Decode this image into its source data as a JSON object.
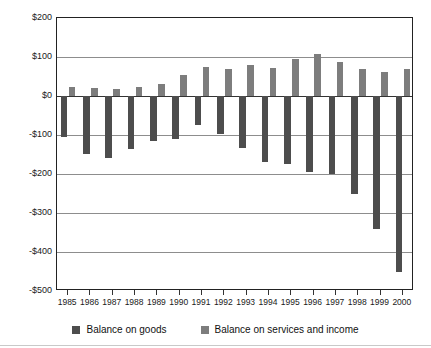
{
  "chart_data": {
    "type": "bar",
    "title": "",
    "subtitle": "",
    "xlabel": "",
    "ylabel": "",
    "grid": true,
    "legend_position": "bottom",
    "ylim": [
      -500,
      200
    ],
    "ytick_labels": [
      "$200",
      "$100",
      "$0",
      "-$100",
      "-$200",
      "-$300",
      "-$400",
      "-$500"
    ],
    "ytick_values": [
      200,
      100,
      0,
      -100,
      -200,
      -300,
      -400,
      -500
    ],
    "categories": [
      "1985",
      "1986",
      "1987",
      "1988",
      "1989",
      "1990",
      "1991",
      "1992",
      "1993",
      "1994",
      "1995",
      "1996",
      "1997",
      "1998",
      "1999",
      "2000"
    ],
    "series": [
      {
        "name": "Balance on goods",
        "color": "#4d4d4d",
        "values": [
          -105,
          -148,
          -160,
          -135,
          -115,
          -110,
          -75,
          -97,
          -133,
          -168,
          -175,
          -195,
          -200,
          -250,
          -340,
          -450
        ]
      },
      {
        "name": "Balance on services and income",
        "color": "#7d7d7d",
        "values": [
          22,
          20,
          17,
          22,
          30,
          55,
          75,
          68,
          80,
          72,
          95,
          108,
          88,
          70,
          62,
          68
        ]
      }
    ]
  },
  "legend": {
    "items": [
      {
        "label": "Balance on goods",
        "swatch": "goods-swatch"
      },
      {
        "label": "Balance on services and income",
        "swatch": "services-swatch"
      }
    ]
  }
}
